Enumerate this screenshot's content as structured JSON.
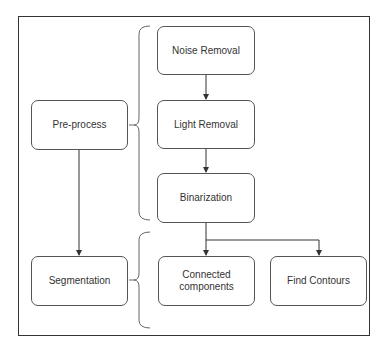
{
  "diagram": {
    "colors": {
      "frame": "#333333",
      "node_border": "#555555",
      "text": "#333333",
      "edge": "#333333",
      "brace": "#666666",
      "background": "#ffffff"
    },
    "nodes": {
      "preprocess": {
        "label": "Pre-process"
      },
      "segmentation": {
        "label": "Segmentation"
      },
      "noise_removal": {
        "label": "Noise Removal"
      },
      "light_removal": {
        "label": "Light Removal"
      },
      "binarization": {
        "label": "Binarization"
      },
      "connected_components": {
        "label": "Connected\ncomponents"
      },
      "find_contours": {
        "label": "Find Contours"
      }
    },
    "edges": [
      {
        "from": "Noise Removal",
        "to": "Light Removal"
      },
      {
        "from": "Light Removal",
        "to": "Binarization"
      },
      {
        "from": "Binarization",
        "to": "Connected components"
      },
      {
        "from": "Binarization",
        "to": "Find Contours"
      },
      {
        "from": "Pre-process",
        "to": "Segmentation"
      }
    ],
    "groups": [
      {
        "parent": "Pre-process",
        "children": [
          "Noise Removal",
          "Light Removal",
          "Binarization"
        ]
      },
      {
        "parent": "Segmentation",
        "children": [
          "Connected components",
          "Find Contours"
        ]
      }
    ]
  }
}
